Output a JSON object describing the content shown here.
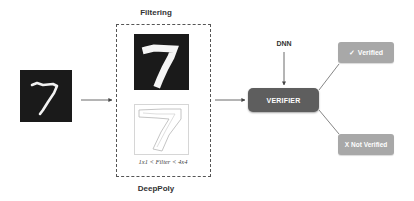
{
  "diagram": {
    "input_image": {
      "label": "7",
      "type": "mnist-digit"
    },
    "filtering_stage": {
      "title": "Filtering",
      "filtered_image": {
        "label": "7",
        "type": "mnist-digit-filtered"
      },
      "outline_image": {
        "label": "7",
        "type": "digit-outline"
      },
      "caption": "1x1 < Filter < 4x4",
      "footer": "DeepPoly"
    },
    "dnn_label": "DNN",
    "verifier_label": "VERIFIER",
    "outcomes": {
      "verified": {
        "icon": "✓",
        "label": "Verified"
      },
      "not_verified": {
        "icon": "X",
        "label": "Not Verified"
      }
    },
    "colors": {
      "verifier_fill": "#5e5e5e",
      "outcome_fill": "#a8a8a8",
      "digit_bg": "#1a1a1a",
      "arrow": "#444444"
    }
  }
}
